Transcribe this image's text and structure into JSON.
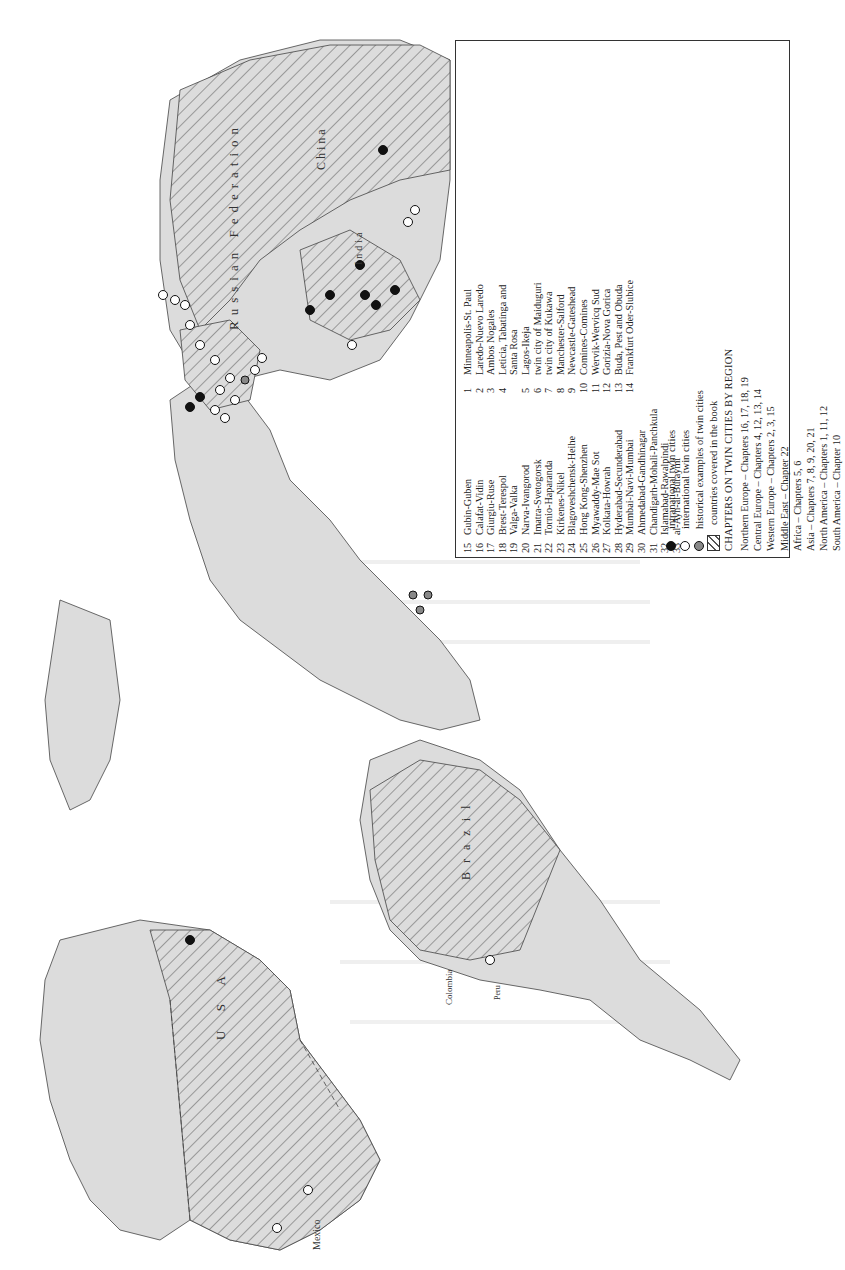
{
  "legend": {
    "numbered_cities": [
      {
        "n": "1",
        "name": "Minneapolis-St. Paul"
      },
      {
        "n": "2",
        "name": "Laredo-Nuevo Laredo"
      },
      {
        "n": "3",
        "name": "Ambos Nogales"
      },
      {
        "n": "4",
        "name": "Leticia, Tabatinga and"
      },
      {
        "n": "",
        "name": "Santa Rosa"
      },
      {
        "n": "5",
        "name": "Lagos-Ikeja"
      },
      {
        "n": "6",
        "name": "twin city of Maiduguri"
      },
      {
        "n": "7",
        "name": "twin city of Kukawa"
      },
      {
        "n": "8",
        "name": "Manchester-Salford"
      },
      {
        "n": "9",
        "name": "Newcastle-Gateshead"
      },
      {
        "n": "10",
        "name": "Comines-Comines"
      },
      {
        "n": "11",
        "name": "Wervik-Wervicq Sud"
      },
      {
        "n": "12",
        "name": "Gorizia-Nova Gorica"
      },
      {
        "n": "13",
        "name": "Buda, Pest and Obuda"
      },
      {
        "n": "14",
        "name": "Frankfurt Oder-Slubice"
      },
      {
        "n": "15",
        "name": "Gubin-Guben"
      },
      {
        "n": "16",
        "name": "Calafat-Vidin"
      },
      {
        "n": "17",
        "name": "Giurgiu-Ruse"
      },
      {
        "n": "18",
        "name": "Brest-Terespol"
      },
      {
        "n": "19",
        "name": "Valga-Valka"
      },
      {
        "n": "20",
        "name": "Narva-Ivangorod"
      },
      {
        "n": "21",
        "name": "Imatra-Svetogorsk"
      },
      {
        "n": "22",
        "name": "Tornio-Haparanda"
      },
      {
        "n": "23",
        "name": "Kirkenes-Nikel"
      },
      {
        "n": "24",
        "name": "Blagoveshchensk-Heihe"
      },
      {
        "n": "25",
        "name": "Hong Kong-Shenzhen"
      },
      {
        "n": "26",
        "name": "Myawaddy-Mae Sot"
      },
      {
        "n": "27",
        "name": "Kolkata-Howrah"
      },
      {
        "n": "28",
        "name": "Hyderabad-Secunderabad"
      },
      {
        "n": "29",
        "name": "Mumbai-Navi-Mumbai"
      },
      {
        "n": "30",
        "name": "Ahmedabad-Gandhinagar"
      },
      {
        "n": "31",
        "name": "Chandigarh-Mohali-Panchkula"
      },
      {
        "n": "32",
        "name": "Islamabad-Rawalpindi"
      },
      {
        "n": "33",
        "name": "al-Ayn-al-Buraymi"
      }
    ],
    "symbols": [
      {
        "type": "black-dot",
        "label": "intranational twin cities"
      },
      {
        "type": "white-dot",
        "label": "international twin cities"
      },
      {
        "type": "grey-dot",
        "label": "historical examples of twin cities"
      },
      {
        "type": "hatch",
        "label": "countries covered in the book"
      }
    ],
    "chapters_title": "CHAPTERS  ON TWIN CITIES BY REGION",
    "chapters": [
      "Northern Europe – Chapters 16, 17, 18, 19",
      "Central Europe – Chapters 4, 12, 13, 14",
      "Western Europe – Chapters 2, 3, 15",
      "Middle East – Chapter 22",
      "Africa – Chapters 5, 6",
      "Asia – Chapters 7, 8, 9, 20, 21",
      "North America – Chapters 1, 11, 12",
      "South America – Chapter 10"
    ]
  },
  "map": {
    "country_labels": {
      "russia": "Russian   Federation",
      "china": "China",
      "india": "India",
      "usa": "U S A",
      "brazil": "B r a z i l",
      "mexico": "Mexico",
      "colombia": "Colombia",
      "peru": "Peru",
      "nigeria": "Nigeria",
      "thailand": "Thailand",
      "myanmar": "Myanmar",
      "pakistan": "Pakistan",
      "oman": "Oman",
      "uae": "UAE",
      "finland": "Finland",
      "sweden": "Sweden",
      "norway": "Norway"
    },
    "city_markers": [
      {
        "n": "1",
        "type": "black"
      },
      {
        "n": "2",
        "type": "white"
      },
      {
        "n": "3",
        "type": "white"
      },
      {
        "n": "4",
        "type": "white"
      },
      {
        "n": "5",
        "type": "grey"
      },
      {
        "n": "6",
        "type": "grey"
      },
      {
        "n": "7",
        "type": "grey"
      },
      {
        "n": "8",
        "type": "black"
      },
      {
        "n": "9",
        "type": "black"
      },
      {
        "n": "10",
        "type": "white"
      },
      {
        "n": "11",
        "type": "white"
      },
      {
        "n": "12",
        "type": "white"
      },
      {
        "n": "13",
        "type": "grey"
      },
      {
        "n": "14",
        "type": "white"
      },
      {
        "n": "15",
        "type": "white"
      },
      {
        "n": "16",
        "type": "white"
      },
      {
        "n": "17",
        "type": "white"
      },
      {
        "n": "18",
        "type": "white"
      },
      {
        "n": "19",
        "type": "white"
      },
      {
        "n": "20",
        "type": "white"
      },
      {
        "n": "21",
        "type": "white"
      },
      {
        "n": "22",
        "type": "white"
      },
      {
        "n": "23",
        "type": "white"
      },
      {
        "n": "24",
        "type": "white"
      },
      {
        "n": "25",
        "type": "black"
      },
      {
        "n": "26",
        "type": "white"
      },
      {
        "n": "27",
        "type": "black"
      },
      {
        "n": "28",
        "type": "black"
      },
      {
        "n": "29",
        "type": "black"
      },
      {
        "n": "30",
        "type": "black"
      },
      {
        "n": "31",
        "type": "black"
      },
      {
        "n": "32",
        "type": "black"
      },
      {
        "n": "33",
        "type": "white"
      }
    ]
  }
}
